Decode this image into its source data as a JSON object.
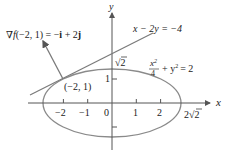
{
  "diagram": {
    "axes": {
      "x_label": "x",
      "y_label": "y",
      "x_ticks": [
        "−2",
        "−1",
        "0",
        "1",
        "2"
      ],
      "x_tick_values": [
        -2,
        -1,
        0,
        1,
        2
      ],
      "y_tick_values": [
        1,
        -1
      ],
      "y_tick_label": "1",
      "x_intercept_label": "2√2",
      "y_intercept_label": "√2"
    },
    "ellipse": {
      "equation_parts": {
        "num": "x",
        "exp": "2",
        "den": "4",
        "rest": "+ y",
        "exp2": "2",
        "rhs": "= 2"
      },
      "a": 2.8284,
      "b": 1.4142,
      "color": "#8a8a8a"
    },
    "tangent_line": {
      "label": "x − 2y = −4",
      "color": "#7a7a7a"
    },
    "point": {
      "label": "(−2, 1)",
      "x": -2,
      "y": 1
    },
    "gradient": {
      "label_nabla": "∇",
      "label_f": "f",
      "label_args": "(−2, 1) = −",
      "label_i": "i",
      "label_plus": " + 2",
      "label_j": "j",
      "vector": [
        -1,
        2
      ],
      "color": "#7a7a7a"
    }
  }
}
